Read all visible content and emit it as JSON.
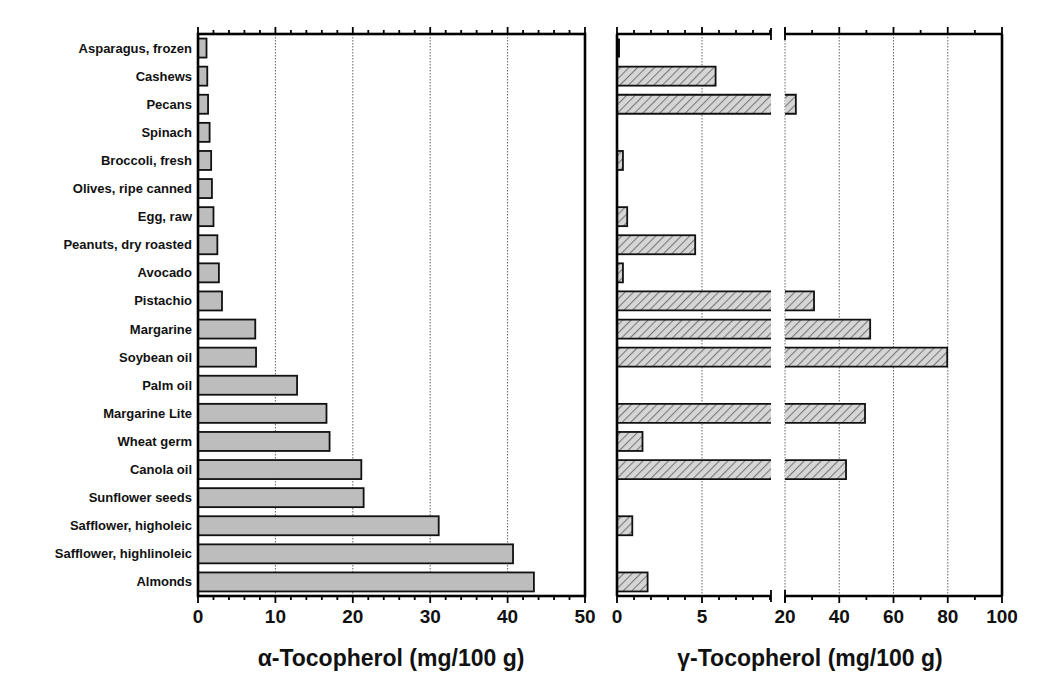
{
  "chart_data": [
    {
      "type": "bar",
      "orientation": "horizontal",
      "title": "",
      "xlabel": "α-Tocopherol (mg/100 g)",
      "ylabel": "",
      "xlim": [
        0,
        50
      ],
      "xticks": [
        0,
        10,
        20,
        30,
        40,
        50
      ],
      "grid": "vertical dotted at major ticks",
      "categories": [
        "Asparagus, frozen",
        "Cashews",
        "Pecans",
        "Spinach",
        "Broccoli, fresh",
        "Olives, ripe canned",
        "Egg, raw",
        "Peanuts, dry roasted",
        "Avocado",
        "Pistachio",
        "Margarine",
        "Soybean oil",
        "Palm oil",
        "Margarine Lite",
        "Wheat germ",
        "Canola oil",
        "Sunflower seeds",
        "Safflower, higholeic",
        "Safflower, highlinoleic",
        "Almonds"
      ],
      "values": [
        1.1,
        1.2,
        1.3,
        1.5,
        1.7,
        1.8,
        2.0,
        2.5,
        2.7,
        3.1,
        7.4,
        7.5,
        12.8,
        16.6,
        17.0,
        21.1,
        21.4,
        31.1,
        40.7,
        43.4
      ],
      "fill": "solid gray"
    },
    {
      "type": "bar",
      "orientation": "horizontal",
      "title": "",
      "xlabel": "γ-Tocopherol (mg/100 g)",
      "ylabel": "",
      "axis_break": {
        "segment1": [
          0,
          9
        ],
        "segment2": [
          20,
          100
        ]
      },
      "xticks": [
        0,
        5,
        20,
        40,
        60,
        80,
        100
      ],
      "grid": "vertical dotted at major ticks",
      "categories": [
        "Asparagus, frozen",
        "Cashews",
        "Pecans",
        "Spinach",
        "Broccoli, fresh",
        "Olives, ripe canned",
        "Egg, raw",
        "Peanuts, dry roasted",
        "Avocado",
        "Pistachio",
        "Margarine",
        "Soybean oil",
        "Palm oil",
        "Margarine Lite",
        "Wheat germ",
        "Canola oil",
        "Sunflower seeds",
        "Safflower, higholeic",
        "Safflower, highlinoleic",
        "Almonds"
      ],
      "values": [
        0.1,
        5.8,
        24.0,
        0,
        0.35,
        0,
        0.6,
        4.6,
        0.35,
        30.7,
        51.4,
        79.8,
        0,
        49.5,
        1.5,
        42.5,
        0,
        0.9,
        0,
        1.8
      ],
      "fill": "diagonal hatch"
    }
  ],
  "labels": {
    "alpha_axis_title": "α-Tocopherol (mg/100 g)",
    "gamma_axis_title": "γ-Tocopherol (mg/100 g)",
    "alpha_ticks": [
      "0",
      "10",
      "20",
      "30",
      "40",
      "50"
    ],
    "gamma_ticks_seg1": [
      "0",
      "5"
    ],
    "gamma_ticks_seg2": [
      "20",
      "40",
      "60",
      "80",
      "100"
    ]
  }
}
